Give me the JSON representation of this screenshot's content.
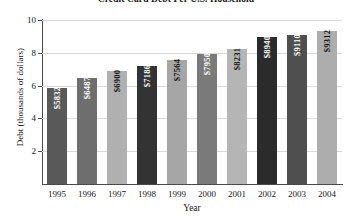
{
  "chart_data": {
    "type": "bar",
    "title": "Credit Card Debt Per U.S. Household",
    "xlabel": "Year",
    "ylabel": "Debt (thousands of dollars)",
    "categories": [
      "1995",
      "1996",
      "1997",
      "1998",
      "1999",
      "2000",
      "2001",
      "2002",
      "2003",
      "2004"
    ],
    "values": [
      5832,
      6487,
      6900,
      7186,
      7564,
      7950,
      8231,
      8940,
      9110,
      9312
    ],
    "value_labels": [
      "$5832",
      "$6487",
      "$6900",
      "$7186",
      "$7564",
      "$7950",
      "$8231",
      "$8940",
      "$9110",
      "$9312"
    ],
    "ylim": [
      0,
      10
    ],
    "yticks": [
      2,
      4,
      6,
      8,
      10
    ],
    "ytick_labels": [
      "2",
      "4",
      "6",
      "8",
      "10"
    ],
    "y_unit_scale": 1000,
    "grid": true,
    "legend": "none",
    "bar_colors": [
      "#595959",
      "#6e6e6e",
      "#b0b0b0",
      "#333333",
      "#a6a6a6",
      "#7a7a7a",
      "#b5b5b5",
      "#2b2b2b",
      "#4f4f4f",
      "#adadad"
    ],
    "bar_label_text_colors": [
      "#ffffff",
      "#ffffff",
      "#151515",
      "#ffffff",
      "#151515",
      "#ffffff",
      "#151515",
      "#ffffff",
      "#ffffff",
      "#151515"
    ],
    "grid_color": "#d8d8d8",
    "axis_color": "#4a4a4a",
    "background": "#ffffff"
  }
}
